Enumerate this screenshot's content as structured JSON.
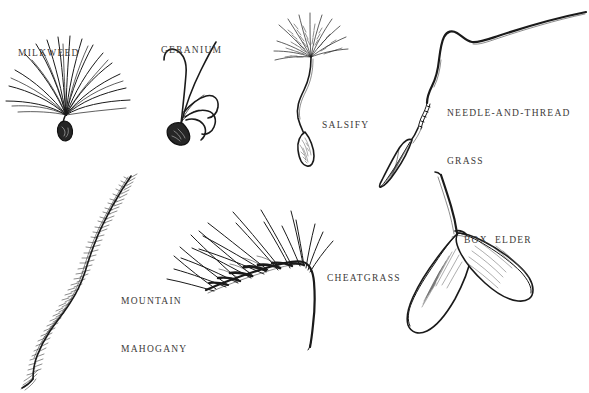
{
  "plate": {
    "title": "Seed dispersal structures plate",
    "background_color": "#ffffff",
    "ink_color": "#1a1a1a",
    "label_color": "#3c3a38",
    "width": 589,
    "height": 393
  },
  "specimens": [
    {
      "id": "milkweed",
      "label": "MILKWEED",
      "label_lines": [
        "MILKWEED"
      ],
      "label_x": 18,
      "label_y": 13,
      "drawing_name": "milkweed-seed-drawing",
      "description": "Seed with fan of long silky pappus hairs"
    },
    {
      "id": "geranium",
      "label": "GERANIUM",
      "label_lines": [
        "GERANIUM"
      ],
      "label_x": 161,
      "label_y": 10,
      "drawing_name": "geranium-seed-drawing",
      "description": "Seed with coiling awns curving outward"
    },
    {
      "id": "salsify",
      "label": "SALSIFY",
      "label_lines": [
        "SALSIFY"
      ],
      "label_x": 322,
      "label_y": 85,
      "drawing_name": "salsify-seed-drawing",
      "description": "Long beaked achene topped by feathery parachute pappus"
    },
    {
      "id": "needle-and-thread-grass",
      "label": "NEEDLE-AND-THREAD GRASS",
      "label_lines": [
        "NEEDLE-AND-THREAD",
        "GRASS"
      ],
      "label_x": 447,
      "label_y": 73,
      "drawing_name": "needle-and-thread-grass-seed-drawing",
      "description": "Sharp-pointed floret with long bent twisted awn"
    },
    {
      "id": "mountain-mahogany",
      "label": "MOUNTAIN MAHOGANY",
      "label_lines": [
        "MOUNTAIN",
        "MAHOGANY"
      ],
      "label_x": 121,
      "label_y": 261,
      "drawing_name": "mountain-mahogany-seed-drawing",
      "description": "Achene with long S-curved plumose twisted tail"
    },
    {
      "id": "cheatgrass",
      "label": "CHEATGRASS",
      "label_lines": [
        "CHEATGRASS"
      ],
      "label_x": 327,
      "label_y": 238,
      "drawing_name": "cheatgrass-seed-drawing",
      "description": "Nodding spikelet of awned florets on arching stem"
    },
    {
      "id": "box-elder",
      "label": "BOX ELDER",
      "label_lines": [
        "BOX  ELDER"
      ],
      "label_x": 464,
      "label_y": 200,
      "drawing_name": "box-elder-seed-drawing",
      "description": "Paired winged samaras hanging from a stalk"
    }
  ]
}
